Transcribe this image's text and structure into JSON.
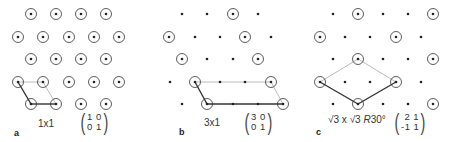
{
  "figure": {
    "colors": {
      "dot": "#222222",
      "circle": "#333333",
      "primary_vectors": "#333333",
      "cell_edges": "#aaaaaa"
    },
    "lattice": {
      "row_y": [
        14,
        37,
        59,
        82,
        104
      ],
      "spacing": 25.3,
      "dot_radius": 1.3,
      "circle_radius": 5.5
    },
    "panels": [
      {
        "id": "a",
        "letter": "a",
        "label": "1x1",
        "matrix": {
          "row1": "1 0",
          "row2": "0 1"
        },
        "rows": [
          {
            "y": 14,
            "points": [
              {
                "x": 31,
                "c": true
              },
              {
                "x": 56,
                "c": true
              },
              {
                "x": 81,
                "c": true
              },
              {
                "x": 106,
                "c": true
              }
            ]
          },
          {
            "y": 37,
            "points": [
              {
                "x": 18,
                "c": true
              },
              {
                "x": 43,
                "c": true
              },
              {
                "x": 69,
                "c": true
              },
              {
                "x": 94,
                "c": true
              },
              {
                "x": 119,
                "c": true
              }
            ]
          },
          {
            "y": 59,
            "points": [
              {
                "x": 31,
                "c": true
              },
              {
                "x": 56,
                "c": true
              },
              {
                "x": 81,
                "c": true
              },
              {
                "x": 106,
                "c": true
              }
            ]
          },
          {
            "y": 82,
            "points": [
              {
                "x": 18,
                "c": true
              },
              {
                "x": 43,
                "c": true
              },
              {
                "x": 69,
                "c": true
              },
              {
                "x": 94,
                "c": true
              },
              {
                "x": 119,
                "c": true
              }
            ]
          },
          {
            "y": 104,
            "points": [
              {
                "x": 31,
                "c": true
              },
              {
                "x": 56,
                "c": true
              },
              {
                "x": 81,
                "c": true
              },
              {
                "x": 106,
                "c": true
              }
            ]
          }
        ],
        "dark_lines": [
          [
            31,
            104,
            18,
            82
          ],
          [
            31,
            104,
            56,
            104
          ]
        ],
        "light_lines": [
          [
            18,
            82,
            43,
            82
          ],
          [
            43,
            82,
            56,
            104
          ]
        ]
      },
      {
        "id": "b",
        "letter": "b",
        "label": "3x1",
        "matrix": {
          "row1": "3 0",
          "row2": "0 1"
        },
        "rows": [
          {
            "y": 14,
            "points": [
              {
                "x": 182,
                "c": false
              },
              {
                "x": 207,
                "c": false
              },
              {
                "x": 233,
                "c": true
              },
              {
                "x": 258,
                "c": false
              }
            ]
          },
          {
            "y": 37,
            "points": [
              {
                "x": 169,
                "c": true
              },
              {
                "x": 195,
                "c": false
              },
              {
                "x": 220,
                "c": false
              },
              {
                "x": 245,
                "c": true
              },
              {
                "x": 271,
                "c": false
              }
            ]
          },
          {
            "y": 59,
            "points": [
              {
                "x": 182,
                "c": true
              },
              {
                "x": 207,
                "c": false
              },
              {
                "x": 233,
                "c": false
              },
              {
                "x": 258,
                "c": true
              }
            ]
          },
          {
            "y": 82,
            "points": [
              {
                "x": 170,
                "c": false
              },
              {
                "x": 195,
                "c": true
              },
              {
                "x": 220,
                "c": false
              },
              {
                "x": 245,
                "c": false
              },
              {
                "x": 271,
                "c": true
              }
            ]
          },
          {
            "y": 104,
            "points": [
              {
                "x": 182,
                "c": false
              },
              {
                "x": 207,
                "c": true
              },
              {
                "x": 233,
                "c": false
              },
              {
                "x": 258,
                "c": false
              },
              {
                "x": 283,
                "c": true
              }
            ]
          }
        ],
        "dark_lines": [
          [
            207,
            104,
            195,
            82
          ],
          [
            207,
            104,
            283,
            104
          ]
        ],
        "light_lines": [
          [
            195,
            82,
            271,
            82
          ],
          [
            271,
            82,
            283,
            104
          ]
        ]
      },
      {
        "id": "c",
        "letter": "c",
        "label": "√3 x √3 R30°",
        "label_parts": {
          "a": "√3",
          "x": " x ",
          "b": "√3",
          "r": " R",
          "angle": "30°"
        },
        "matrix": {
          "row1": " 2 1",
          "row2": "-1 1"
        },
        "rows": [
          {
            "y": 14,
            "points": [
              {
                "x": 333,
                "c": false
              },
              {
                "x": 358,
                "c": true
              },
              {
                "x": 383,
                "c": false
              },
              {
                "x": 408,
                "c": false
              },
              {
                "x": 433,
                "c": true
              }
            ]
          },
          {
            "y": 37,
            "points": [
              {
                "x": 320,
                "c": true
              },
              {
                "x": 345,
                "c": false
              },
              {
                "x": 370,
                "c": false
              },
              {
                "x": 396,
                "c": true
              },
              {
                "x": 421,
                "c": false
              }
            ]
          },
          {
            "y": 59,
            "points": [
              {
                "x": 333,
                "c": false
              },
              {
                "x": 358,
                "c": true
              },
              {
                "x": 383,
                "c": false
              },
              {
                "x": 408,
                "c": false
              },
              {
                "x": 433,
                "c": true
              }
            ]
          },
          {
            "y": 82,
            "points": [
              {
                "x": 320,
                "c": true
              },
              {
                "x": 345,
                "c": false
              },
              {
                "x": 370,
                "c": false
              },
              {
                "x": 396,
                "c": true
              },
              {
                "x": 421,
                "c": false
              }
            ]
          },
          {
            "y": 104,
            "points": [
              {
                "x": 333,
                "c": false
              },
              {
                "x": 358,
                "c": true
              },
              {
                "x": 383,
                "c": false
              },
              {
                "x": 408,
                "c": false
              },
              {
                "x": 433,
                "c": true
              }
            ]
          }
        ],
        "dark_lines": [
          [
            358,
            104,
            320,
            82
          ],
          [
            358,
            104,
            396,
            82
          ]
        ],
        "light_lines": [
          [
            320,
            82,
            358,
            59
          ],
          [
            358,
            59,
            396,
            82
          ]
        ]
      }
    ]
  }
}
